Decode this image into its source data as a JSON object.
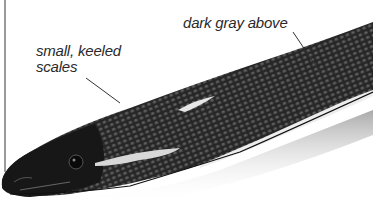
{
  "figure": {
    "labels": [
      {
        "id": "keeled-scales",
        "text_line1": "small, keeled",
        "text_line2": "scales"
      },
      {
        "id": "dark-gray-above",
        "text": "dark gray above"
      }
    ],
    "colors": {
      "background": "#ffffff",
      "body_dark": "#1c1c1c",
      "body_mid": "#3a3a3a",
      "scale_highlight": "#8a8a8a",
      "belly_light": "#e8e8e8",
      "shadow": "#bdbdbd",
      "leader_line": "#333333",
      "edge_line": "#9a9a9a"
    }
  }
}
